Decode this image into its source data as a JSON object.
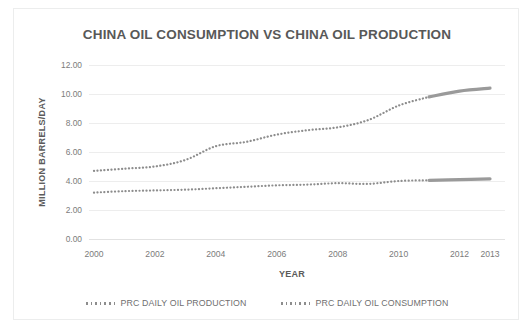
{
  "chart_data": {
    "type": "line",
    "title": "CHINA OIL CONSUMPTION VS CHINA OIL PRODUCTION",
    "xlabel": "YEAR",
    "ylabel": "MILLION BARRELS/DAY",
    "xlim": [
      2000,
      2013
    ],
    "ylim": [
      0,
      12
    ],
    "ytick_labels": [
      "12.00",
      "10.00",
      "8.00",
      "6.00",
      "4.00",
      "2.00",
      "0.00"
    ],
    "ytick_values": [
      12,
      10,
      8,
      6,
      4,
      2,
      0
    ],
    "xtick_labels": [
      "2000",
      "2002",
      "2004",
      "2006",
      "2008",
      "2010",
      "2012",
      "2013"
    ],
    "xtick_values": [
      2000,
      2002,
      2004,
      2006,
      2008,
      2010,
      2012,
      2013
    ],
    "grid": true,
    "legend_position": "bottom",
    "x": [
      2000,
      2001,
      2002,
      2003,
      2004,
      2005,
      2006,
      2007,
      2008,
      2009,
      2010,
      2011,
      2012,
      2013
    ],
    "series": [
      {
        "name": "PRC DAILY OIL PRODUCTION",
        "color": "#8d8d8d",
        "style": "dotted",
        "values": [
          3.2,
          3.3,
          3.35,
          3.4,
          3.5,
          3.6,
          3.7,
          3.75,
          3.85,
          3.8,
          4.0,
          4.05,
          4.1,
          4.15
        ]
      },
      {
        "name": "PRC DAILY OIL CONSUMPTION",
        "color": "#8d8d8d",
        "style": "dotted",
        "values": [
          4.7,
          4.85,
          5.0,
          5.45,
          6.4,
          6.7,
          7.2,
          7.5,
          7.7,
          8.2,
          9.2,
          9.8,
          10.2,
          10.4
        ]
      }
    ],
    "annotations": [
      {
        "note": "final segment (2011-2013) rendered as thicker solid line on both series"
      }
    ]
  },
  "legend": {
    "items": [
      {
        "label": "PRC DAILY OIL PRODUCTION",
        "color": "#8d8d8d"
      },
      {
        "label": "PRC DAILY OIL CONSUMPTION",
        "color": "#8d8d8d"
      }
    ]
  }
}
